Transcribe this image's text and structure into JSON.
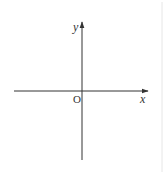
{
  "diagram": {
    "type": "cartesian-axes",
    "labels": {
      "y_axis": "y",
      "x_axis": "x",
      "origin": "O"
    },
    "colors": {
      "axis": "#333333",
      "border": "#e6e6e6",
      "background": "#ffffff"
    }
  }
}
